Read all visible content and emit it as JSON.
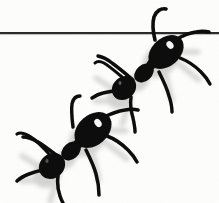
{
  "figure": {
    "kind": "scanned-photograph-illustration",
    "caption": "Two black ants, shown from above, walking in single file from lower-left to upper-right across a plain white field. A thin horizontal rule crosses the full width near the top of the frame; the leading ant's left antenna curls up and over the rule.",
    "width_px": 219,
    "height_px": 203,
    "background_color": "#fdfdfc",
    "ink_color": "#0a0a0a",
    "shadow_color": "#bfbfbd",
    "highlight_color": "#ffffff"
  },
  "rule": {
    "name": "horizontal-rule",
    "description": "Thin dark horizontal line spanning the entire image width near the top",
    "y_px": 33,
    "thickness_px": 2,
    "x_start_px": 0,
    "x_end_px": 219,
    "color": "#2b2b2b"
  },
  "subjects": [
    {
      "id": "ant-leading",
      "label": "Leading ant (upper right)",
      "position_note": "upper-right, partially overlapping the horizontal rule",
      "body_axis_degrees": 48,
      "parts": {
        "gaster": {
          "cx": 166,
          "cy": 52,
          "rx": 20,
          "ry": 14,
          "rotation_deg": -42,
          "highlight": true
        },
        "thorax": {
          "cx": 144,
          "cy": 73,
          "rx": 11,
          "ry": 8,
          "rotation_deg": -42
        },
        "head": {
          "cx": 124,
          "cy": 88,
          "rx": 13,
          "ry": 11,
          "rotation_deg": -42
        }
      },
      "leg_count": 6,
      "antenna_count": 2,
      "antenna_note": "left antenna arcs upward crossing the horizontal rule"
    },
    {
      "id": "ant-following",
      "label": "Following ant (lower left)",
      "position_note": "lower-left, fully below the horizontal rule",
      "body_axis_degrees": 48,
      "parts": {
        "gaster": {
          "cx": 93,
          "cy": 130,
          "rx": 21,
          "ry": 15,
          "rotation_deg": -42,
          "highlight": true
        },
        "thorax": {
          "cx": 71,
          "cy": 151,
          "rx": 11,
          "ry": 8,
          "rotation_deg": -42
        },
        "head": {
          "cx": 52,
          "cy": 166,
          "rx": 14,
          "ry": 12,
          "rotation_deg": -42
        }
      },
      "leg_count": 6,
      "antenna_count": 2,
      "antenna_note": "both antennae sweep forward and up to the left and right of the head"
    }
  ],
  "text_content": {
    "visible_text": "",
    "note": "No text, labels, numbers, axes or legend appear anywhere in the image."
  }
}
